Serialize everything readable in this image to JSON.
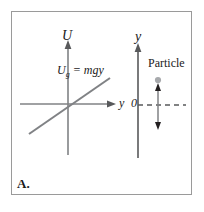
{
  "figure": {
    "panel_label": "A.",
    "type": "physics-potential-energy-diagram",
    "frame_color": "#9a9a9a",
    "background": "#ffffff"
  },
  "left_plot": {
    "vertical_axis_label": "U",
    "horizontal_axis_label": "y",
    "line_label_main": "U",
    "line_label_sub": "g",
    "line_label_rest": " = mgy",
    "line_equation": "U_g = mgy",
    "line_color": "#808285",
    "axis_color": "#808285"
  },
  "right_plot": {
    "axis_label": "y",
    "origin_label": "0",
    "particle_label": "Particle",
    "axis_color": "#58595b",
    "dot_color": "#a7a9ac",
    "arrow_color": "#808285",
    "dash_color": "#58595b"
  }
}
